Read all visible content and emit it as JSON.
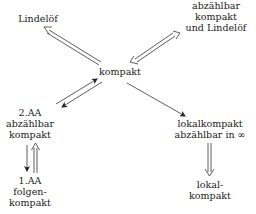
{
  "diagram": {
    "nodes": {
      "lindeloef": {
        "label": [
          "Lindelöf"
        ]
      },
      "abz_kompakt_lindeloef": {
        "label": [
          "abzählbar",
          "kompakt",
          "und Lindelöf"
        ]
      },
      "kompakt": {
        "label": [
          "kompakt"
        ]
      },
      "aa2_abz_kompakt": {
        "label": [
          "2.AA",
          "abzählbar",
          "kompakt"
        ]
      },
      "aa1_folgenkompakt": {
        "label": [
          "1.AA",
          "folgen-",
          "kompakt"
        ]
      },
      "lokalkompakt_abz_inf": {
        "label": [
          "lokalkompakt",
          "abzählbar in ∞"
        ]
      },
      "lokalkompakt": {
        "label": [
          "lokal-",
          "kompakt"
        ]
      }
    },
    "edges": [
      {
        "from": "kompakt",
        "to": "Lindelöf",
        "style": "double"
      },
      {
        "from": "abzählbar kompakt und Lindelöf",
        "to": "kompakt",
        "style": "double-bidirectional"
      },
      {
        "from": "2.AA abzählbar kompakt",
        "to": "kompakt",
        "style": "single"
      },
      {
        "from": "kompakt",
        "to": "2.AA abzählbar kompakt",
        "style": "single"
      },
      {
        "from": "kompakt",
        "to": "lokalkompakt abzählbar in ∞",
        "style": "single"
      },
      {
        "from": "lokalkompakt abzählbar in ∞",
        "to": "lokal-kompakt",
        "style": "double"
      },
      {
        "from": "2.AA abzählbar kompakt",
        "to": "1.AA folgen-kompakt",
        "style": "single"
      },
      {
        "from": "1.AA folgen-kompakt",
        "to": "2.AA abzählbar kompakt",
        "style": "double"
      }
    ]
  }
}
